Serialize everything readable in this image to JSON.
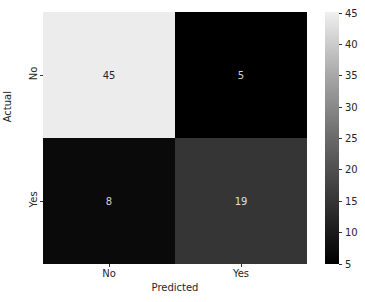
{
  "chart_data": {
    "type": "heatmap",
    "title": "",
    "xlabel": "Predicted",
    "ylabel": "Actual",
    "x_categories": [
      "No",
      "Yes"
    ],
    "y_categories": [
      "No",
      "Yes"
    ],
    "values": [
      [
        45,
        5
      ],
      [
        8,
        19
      ]
    ],
    "colormap": "gray",
    "colorbar": {
      "min": 5,
      "max": 45,
      "ticks": [
        5,
        10,
        15,
        20,
        25,
        30,
        35,
        40,
        45
      ]
    },
    "annotations": true
  },
  "cells": [
    {
      "row": 0,
      "col": 0,
      "label": "45",
      "bg": "#ececec",
      "fg": "#262626"
    },
    {
      "row": 0,
      "col": 1,
      "label": "5",
      "bg": "#000000",
      "fg": "#d0d0d0"
    },
    {
      "row": 1,
      "col": 0,
      "label": "8",
      "bg": "#0a0a0a",
      "fg": "#d0d0d0"
    },
    {
      "row": 1,
      "col": 1,
      "label": "19",
      "bg": "#353535",
      "fg": "#e0e0e0"
    }
  ],
  "axes": {
    "xlabel": "Predicted",
    "ylabel": "Actual",
    "xticks": [
      "No",
      "Yes"
    ],
    "yticks": [
      "No",
      "Yes"
    ]
  },
  "colorbar": {
    "ticks": [
      "45",
      "40",
      "35",
      "30",
      "25",
      "20",
      "15",
      "10",
      "5"
    ]
  }
}
